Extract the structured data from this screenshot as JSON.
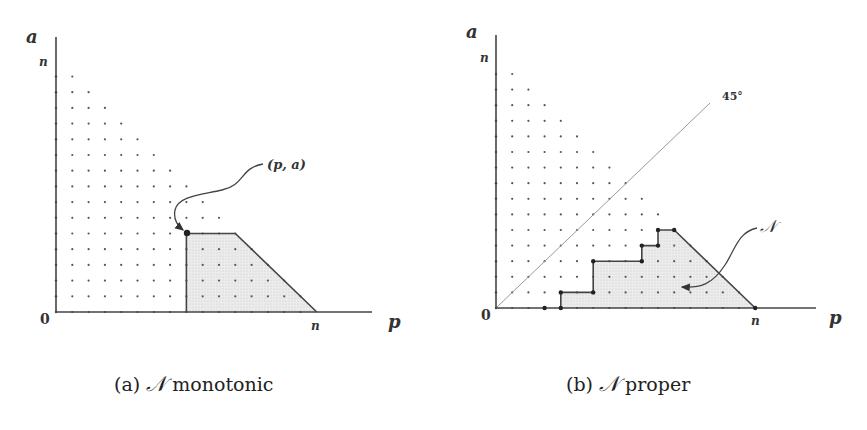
{
  "figures": [
    {
      "id": "a",
      "caption_prefix": "(a)",
      "caption_symbol": "𝒩",
      "caption_text": "monotonic",
      "axis": {
        "origin_label": "0",
        "x_label": "p",
        "y_label": "a",
        "x_tick_label": "n",
        "y_tick_label": "n"
      },
      "annotation": "(p, a)",
      "grid_n": 16,
      "region": [
        [
          8,
          0
        ],
        [
          8,
          5
        ],
        [
          11,
          5
        ],
        [
          16,
          0
        ]
      ],
      "marked_point": [
        8,
        5
      ]
    },
    {
      "id": "b",
      "caption_prefix": "(b)",
      "caption_symbol": "𝒩",
      "caption_text": "proper",
      "axis": {
        "origin_label": "0",
        "x_label": "p",
        "y_label": "a",
        "x_tick_label": "n",
        "y_tick_label": "n"
      },
      "diagonal_label": "45°",
      "annotation": "𝒩",
      "grid_n": 16,
      "region": [
        [
          4,
          0
        ],
        [
          4,
          1
        ],
        [
          6,
          1
        ],
        [
          6,
          3
        ],
        [
          9,
          3
        ],
        [
          9,
          4
        ],
        [
          10,
          4
        ],
        [
          10,
          5
        ],
        [
          11,
          5
        ],
        [
          16,
          0
        ]
      ],
      "marked_points": [
        [
          3,
          0
        ],
        [
          4,
          0
        ],
        [
          4,
          1
        ],
        [
          6,
          1
        ],
        [
          6,
          3
        ],
        [
          9,
          3
        ],
        [
          9,
          4
        ],
        [
          10,
          4
        ],
        [
          10,
          5
        ],
        [
          11,
          5
        ],
        [
          16,
          0
        ]
      ]
    }
  ],
  "colors": {
    "ink": "#333333",
    "fill": "#e4e4e4",
    "dot": "#555555",
    "diagonal": "#999999"
  }
}
